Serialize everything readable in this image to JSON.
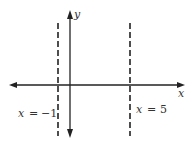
{
  "diagram": {
    "type": "coordinate-plane",
    "axes": {
      "x_label": "x",
      "y_label": "y"
    },
    "vertical_asymptotes": [
      {
        "label_var": "x",
        "label_eq": "=",
        "label_val": "−1",
        "x_value": -1,
        "style": "dashed"
      },
      {
        "label_var": "x",
        "label_eq": "=",
        "label_val": "5",
        "x_value": 5,
        "style": "dashed"
      }
    ],
    "colors": {
      "line": "#222222",
      "text": "#333333",
      "background": "#ffffff"
    }
  }
}
